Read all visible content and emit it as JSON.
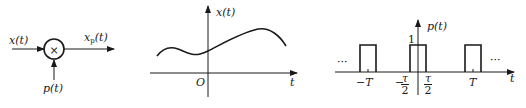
{
  "multiplier_block": {
    "input_label": "x(t)",
    "output_label_main": "x",
    "output_label_sub": "p",
    "output_label_arg": "(t)",
    "modulating_label": "p(t)",
    "operator_symbol": "×"
  },
  "signal_plot": {
    "y_label": "x(t)",
    "x_label": "t",
    "origin_label": "O"
  },
  "pulse_train_plot": {
    "y_label": "p(t)",
    "x_label": "t",
    "amplitude_label": "1",
    "left_ellipsis": "···",
    "right_ellipsis": "···",
    "tick_neg_T": "−T",
    "tick_pos_T": "T",
    "tau_symbol": "τ",
    "tau_denominator": "2",
    "neg_sign": "−"
  }
}
